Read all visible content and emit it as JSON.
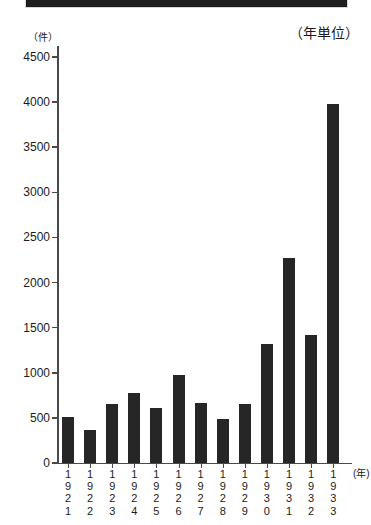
{
  "header": {
    "title": ""
  },
  "captions": {
    "y_unit": "（件）",
    "right_note": "（年単位）",
    "x_unit": "(年)"
  },
  "chart_data": {
    "type": "bar",
    "title": "",
    "xlabel": "(年)",
    "ylabel": "（件）",
    "ylim": [
      0,
      4500
    ],
    "ytick_step": 500,
    "grid": false,
    "legend": null,
    "note": "（年単位）",
    "ytick_labels": [
      "4500",
      "4000",
      "3500",
      "3000",
      "2500",
      "2000",
      "1500",
      "1000",
      "500",
      "0"
    ],
    "categories": [
      "1921",
      "1922",
      "1923",
      "1924",
      "1925",
      "1926",
      "1927",
      "1928",
      "1929",
      "1930",
      "1931",
      "1932",
      "1933"
    ],
    "values": [
      505,
      370,
      650,
      780,
      615,
      970,
      660,
      490,
      650,
      1320,
      2270,
      1420,
      3980
    ],
    "bar_color": "#262626"
  }
}
